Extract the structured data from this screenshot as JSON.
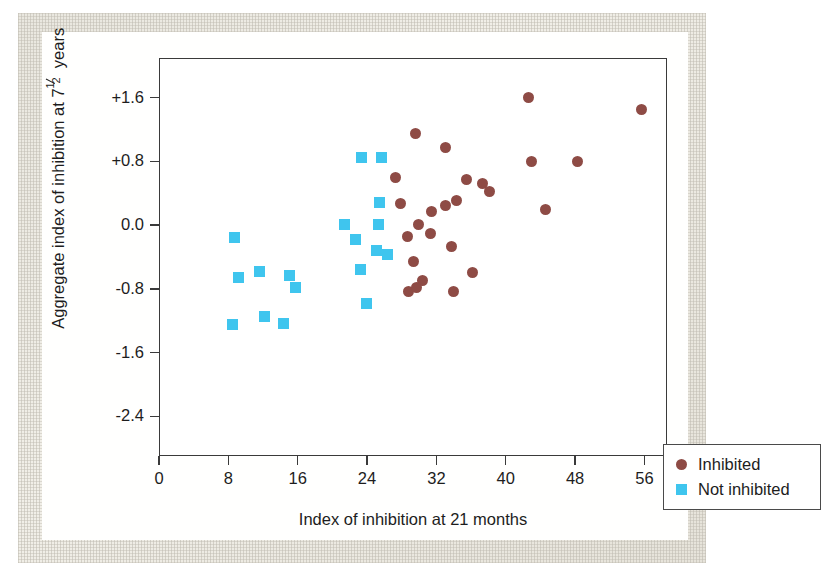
{
  "chart_data": {
    "type": "scatter",
    "title": "",
    "xlabel": "Index of inhibition at 21 months",
    "ylabel_prefix": "Aggregate index of inhibition at 7",
    "ylabel_frac_num": "1",
    "ylabel_frac_den": "2",
    "ylabel_suffix": " years",
    "xlim": [
      0,
      58.6
    ],
    "ylim": [
      -2.9,
      2.1
    ],
    "xticks": [
      0,
      8,
      16,
      24,
      32,
      40,
      48,
      56
    ],
    "xtick_labels": [
      "0",
      "8",
      "16",
      "24",
      "32",
      "40",
      "48",
      "56"
    ],
    "yticks": [
      1.6,
      0.8,
      0.0,
      -0.8,
      -1.6,
      -2.4
    ],
    "ytick_labels": [
      "+1.6",
      "+0.8",
      "0.0",
      "-0.8",
      "-1.6",
      "-2.4"
    ],
    "grid": false,
    "legend_position": "bottom-right",
    "series": [
      {
        "name": "Inhibited",
        "marker": "circle",
        "color": "#8e4b45",
        "points": [
          [
            42.5,
            1.62
          ],
          [
            55.6,
            1.46
          ],
          [
            29.5,
            1.17
          ],
          [
            32.9,
            0.99
          ],
          [
            42.8,
            0.81
          ],
          [
            48.2,
            0.81
          ],
          [
            27.2,
            0.61
          ],
          [
            37.2,
            0.54
          ],
          [
            35.4,
            0.59
          ],
          [
            38.0,
            0.43
          ],
          [
            34.2,
            0.32
          ],
          [
            32.9,
            0.26
          ],
          [
            31.3,
            0.19
          ],
          [
            44.5,
            0.21
          ],
          [
            27.7,
            0.29
          ],
          [
            29.8,
            0.02
          ],
          [
            31.2,
            -0.09
          ],
          [
            28.6,
            -0.13
          ],
          [
            33.6,
            -0.26
          ],
          [
            29.2,
            -0.44
          ],
          [
            30.3,
            -0.68
          ],
          [
            28.7,
            -0.82
          ],
          [
            33.8,
            -0.82
          ],
          [
            29.6,
            -0.77
          ],
          [
            36.0,
            -0.58
          ]
        ]
      },
      {
        "name": "Not inhibited",
        "marker": "square",
        "color": "#3fc5ee",
        "points": [
          [
            23.3,
            0.86
          ],
          [
            25.5,
            0.86
          ],
          [
            25.3,
            0.3
          ],
          [
            21.3,
            0.02
          ],
          [
            25.2,
            0.02
          ],
          [
            22.6,
            -0.17
          ],
          [
            25.0,
            -0.3
          ],
          [
            26.2,
            -0.35
          ],
          [
            23.1,
            -0.54
          ],
          [
            8.6,
            -0.14
          ],
          [
            9.1,
            -0.65
          ],
          [
            14.9,
            -0.62
          ],
          [
            15.6,
            -0.77
          ],
          [
            11.5,
            -0.57
          ],
          [
            8.4,
            -1.23
          ],
          [
            12.1,
            -1.14
          ],
          [
            14.2,
            -1.22
          ],
          [
            23.8,
            -0.97
          ]
        ]
      }
    ]
  },
  "legend": {
    "items": [
      {
        "label": "Inhibited",
        "marker": "circle",
        "color": "#8e4b45"
      },
      {
        "label": "Not inhibited",
        "marker": "square",
        "color": "#3fc5ee"
      }
    ]
  }
}
